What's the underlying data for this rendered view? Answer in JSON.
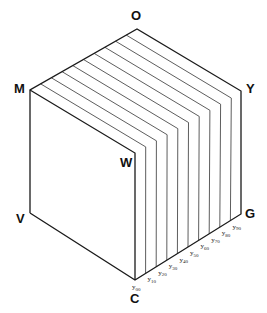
{
  "diagram": {
    "type": "isometric-cube-slices",
    "vertices": {
      "O": {
        "label": "O",
        "x": 137,
        "y": 29
      },
      "M": {
        "label": "M",
        "x": 30,
        "y": 90
      },
      "Y": {
        "label": "Y",
        "x": 241,
        "y": 91
      },
      "W": {
        "label": "W",
        "x": 135,
        "y": 153
      },
      "V": {
        "label": "V",
        "x": 30,
        "y": 213
      },
      "C": {
        "label": "C",
        "x": 135,
        "y": 280
      },
      "G": {
        "label": "G",
        "x": 241,
        "y": 214
      }
    },
    "slice_count": 10,
    "slice_labels": [
      "y00",
      "y10",
      "y20",
      "y30",
      "y40",
      "y50",
      "y60",
      "y70",
      "y80",
      "y90"
    ],
    "colors": {
      "line": "#1a1a1a",
      "background": "#ffffff"
    }
  }
}
